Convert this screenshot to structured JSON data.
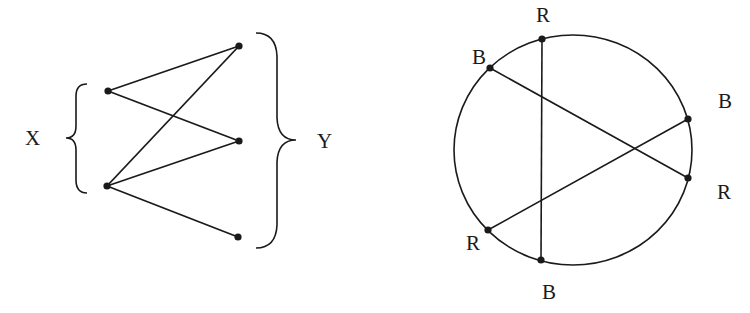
{
  "bipartite": {
    "left_set_label": "X",
    "right_set_label": "Y",
    "x_nodes": [
      {
        "id": "x1",
        "cx": 108,
        "cy": 91
      },
      {
        "id": "x2",
        "cx": 107,
        "cy": 186
      }
    ],
    "y_nodes": [
      {
        "id": "y1",
        "cx": 239,
        "cy": 46
      },
      {
        "id": "y2",
        "cx": 239,
        "cy": 141
      },
      {
        "id": "y3",
        "cx": 238,
        "cy": 237
      }
    ],
    "edges": [
      [
        "x1",
        "y1"
      ],
      [
        "x1",
        "y2"
      ],
      [
        "x2",
        "y1"
      ],
      [
        "x2",
        "y2"
      ],
      [
        "x2",
        "y3"
      ]
    ]
  },
  "circle_graph": {
    "circle": {
      "cx": 573,
      "cy": 150,
      "rx": 119,
      "ry": 115
    },
    "points": [
      {
        "id": "p1",
        "label": "R",
        "cx": 542,
        "cy": 39,
        "lx": 536,
        "ly": 22
      },
      {
        "id": "p2",
        "label": "B",
        "cx": 490,
        "cy": 68,
        "lx": 472,
        "ly": 64
      },
      {
        "id": "p3",
        "label": "B",
        "cx": 688,
        "cy": 119,
        "lx": 718,
        "ly": 108
      },
      {
        "id": "p4",
        "label": "R",
        "cx": 688,
        "cy": 178,
        "lx": 717,
        "ly": 199
      },
      {
        "id": "p5",
        "label": "R",
        "cx": 488,
        "cy": 230,
        "lx": 466,
        "ly": 250
      },
      {
        "id": "p6",
        "label": "B",
        "cx": 541,
        "cy": 260,
        "lx": 542,
        "ly": 299
      }
    ],
    "chords": [
      [
        "p1",
        "p6"
      ],
      [
        "p2",
        "p4"
      ],
      [
        "p3",
        "p5"
      ]
    ]
  },
  "colors": {
    "ink": "#1a1a1a",
    "background": "#ffffff"
  }
}
